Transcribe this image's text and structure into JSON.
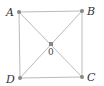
{
  "diagram": {
    "type": "square-with-diagonals",
    "points": {
      "A": {
        "label": "A",
        "x": 19,
        "y": 12
      },
      "B": {
        "label": "B",
        "x": 82,
        "y": 11
      },
      "C": {
        "label": "C",
        "x": 82,
        "y": 77
      },
      "D": {
        "label": "D",
        "x": 20,
        "y": 78
      },
      "O": {
        "label": "0",
        "x": 51,
        "y": 44
      }
    },
    "edges": [
      [
        "A",
        "B"
      ],
      [
        "B",
        "C"
      ],
      [
        "C",
        "D"
      ],
      [
        "D",
        "A"
      ],
      [
        "A",
        "C"
      ],
      [
        "B",
        "D"
      ]
    ],
    "colors": {
      "line": "#bbbbbb",
      "point": "#888888",
      "label": "#333333"
    }
  }
}
